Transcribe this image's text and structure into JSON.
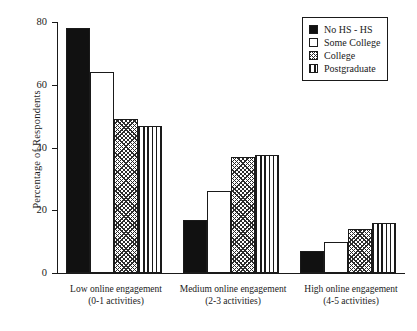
{
  "chart_data": {
    "type": "bar",
    "title": "",
    "subtitle": "",
    "xlabel": "",
    "ylabel": "Percentage of Respondents",
    "ylim": [
      0,
      80
    ],
    "yticks": [
      0,
      20,
      40,
      60,
      80
    ],
    "ytick_labels": [
      "0",
      "20",
      "40",
      "60",
      "80"
    ],
    "grid": false,
    "legend_position": "top-right",
    "categories": [
      "Low online engagement (0-1 activities)",
      "Medium online engagement (2-3 activities)",
      "High online engagement (4-5 activities)"
    ],
    "category_lines": [
      {
        "line1": "Low online engagement",
        "line2": "(0-1 activities)"
      },
      {
        "line1": "Medium online engagement",
        "line2": "(2-3 activities)"
      },
      {
        "line1": "High online engagement",
        "line2": "(4-5 activities)"
      }
    ],
    "series": [
      {
        "name": "No HS - HS",
        "fill": "solid",
        "values": [
          78,
          17,
          7
        ]
      },
      {
        "name": "Some College",
        "fill": "white",
        "values": [
          64,
          26,
          10
        ]
      },
      {
        "name": "College",
        "fill": "cross",
        "values": [
          49,
          37,
          14
        ]
      },
      {
        "name": "Postgraduate",
        "fill": "vert",
        "values": [
          47,
          37.5,
          16
        ]
      }
    ]
  },
  "legend": {
    "items": [
      {
        "label": "No HS - HS",
        "swatch": "solid-square-swatch"
      },
      {
        "label": "Some College",
        "swatch": "empty-square-swatch"
      },
      {
        "label": "College",
        "swatch": "crosshatch-square-swatch"
      },
      {
        "label": "Postgraduate",
        "swatch": "vertical-stripe-square-swatch"
      }
    ]
  },
  "axes": {
    "y_title": "Percentage of Respondents",
    "y_tick_labels": [
      "80",
      "60",
      "40",
      "20",
      "0"
    ],
    "x_tick_labels": [
      "Low online engagement",
      "(0-1 activities)",
      "Medium online engagement",
      "(2-3 activities)",
      "High online engagement",
      "(4-5 activities)"
    ]
  },
  "colors": {
    "ink": "#1a1a1a",
    "bar_solid": "#111111",
    "bar_white": "#ffffff",
    "hatch": "#2b2b2b",
    "background": "#ffffff"
  }
}
